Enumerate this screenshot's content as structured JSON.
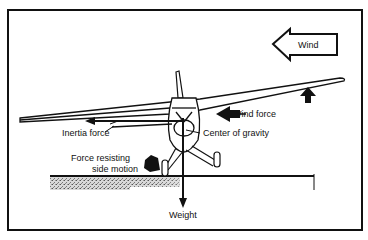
{
  "diagram": {
    "labels": {
      "wind": "Wind",
      "wind_force": "Wind force",
      "inertia_force": "Inertia force",
      "center_of_gravity": "Center of gravity",
      "force_resisting_line1": "Force resisting",
      "force_resisting_line2": "side motion",
      "weight": "Weight"
    },
    "colors": {
      "ink": "#111111",
      "background": "#ffffff",
      "ground": "#9a9a9a"
    }
  }
}
